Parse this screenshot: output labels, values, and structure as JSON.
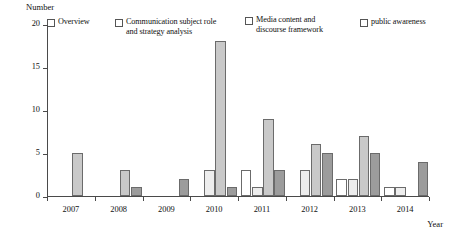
{
  "chart_data": {
    "type": "bar",
    "title": "",
    "subtitle": "",
    "xlabel": "Year",
    "ylabel": "Number",
    "categories": [
      "2007",
      "2008",
      "2009",
      "2010",
      "2011",
      "2012",
      "2013",
      "2014"
    ],
    "yticks": [
      "0",
      "5",
      "10",
      "15",
      "20"
    ],
    "ylim": [
      0,
      20
    ],
    "grid": false,
    "legend_position": "top",
    "series": [
      {
        "name": "Overview",
        "color": "#ffffff",
        "values": [
          0,
          0,
          0,
          0,
          3,
          0,
          2,
          1
        ]
      },
      {
        "name": "Communication subject role\nand strategy analysis",
        "color": "#ededed",
        "values": [
          0,
          0,
          0,
          3,
          1,
          3,
          2,
          1
        ]
      },
      {
        "name": "Media content and\ndiscourse framework",
        "color": "#c9c9c9",
        "values": [
          5,
          3,
          0,
          18,
          9,
          6,
          7,
          0
        ]
      },
      {
        "name": "public awareness",
        "color": "#9c9c9c",
        "values": [
          0,
          1,
          2,
          1,
          3,
          5,
          5,
          4
        ]
      }
    ]
  },
  "axes": {
    "y_title": "Number",
    "x_title": "Year"
  }
}
